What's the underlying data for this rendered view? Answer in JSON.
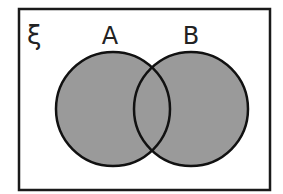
{
  "diagram": {
    "type": "venn",
    "universal_set": {
      "label": "ξ",
      "stroke": "#1a1a1a",
      "fill": "#ffffff"
    },
    "sets": [
      {
        "label": "A",
        "fill": "#9a9a9a",
        "stroke": "#111111",
        "shaded": true
      },
      {
        "label": "B",
        "fill": "#9a9a9a",
        "stroke": "#111111",
        "shaded": true
      }
    ],
    "shaded_region": "A ∪ B"
  }
}
